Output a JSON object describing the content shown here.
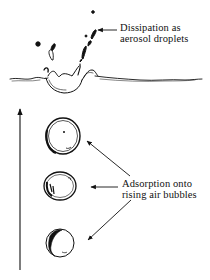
{
  "diagram": {
    "type": "process-illustration",
    "labels": {
      "aerosol": {
        "line1": "Dissipation as",
        "line2": "aerosol droplets"
      },
      "bubbles": {
        "line1": "Adsorption onto",
        "line2": "rising air bubbles"
      }
    },
    "elements": {
      "water_surface": "wavy water surface line with splash",
      "droplets": "aerosol droplets ejected above surface",
      "bubbles": [
        "upper bubble",
        "middle bubble",
        "lower bubble"
      ],
      "rise_arrow": "vertical upward arrow indicating bubble rise direction"
    },
    "colors": {
      "ink": "#111111",
      "background": "#ffffff"
    }
  }
}
